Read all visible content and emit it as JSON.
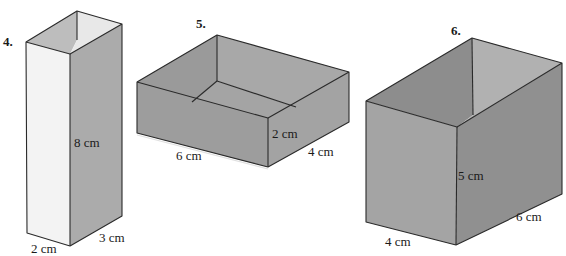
{
  "figures": [
    {
      "number": "4.",
      "shape": "open-top rectangular prism (box)",
      "dimensions": {
        "height": "8 cm",
        "width": "2 cm",
        "depth": "3 cm"
      },
      "colors": {
        "front": "#f1f1f1",
        "side": "#a9a9a9",
        "inner_back": "#e6e6e6",
        "inner_left": "#bdbdbd"
      }
    },
    {
      "number": "5.",
      "shape": "open-top rectangular prism (box)",
      "dimensions": {
        "length": "6 cm",
        "height": "2 cm",
        "width": "4 cm"
      },
      "colors": {
        "front": "#9c9c9c",
        "side": "#a2a2a2",
        "inner_back": "#a7a7a7",
        "inner_left": "#9a9a9a",
        "floor": "#a4a4a4"
      }
    },
    {
      "number": "6.",
      "shape": "open-top rectangular prism (box)",
      "dimensions": {
        "height": "5 cm",
        "width": "4 cm",
        "length": "6 cm"
      },
      "colors": {
        "front": "#a3a3a3",
        "side": "#8f8f8f",
        "inner_back": "#b0b0b0",
        "inner_left": "#8c8c8c"
      }
    }
  ]
}
